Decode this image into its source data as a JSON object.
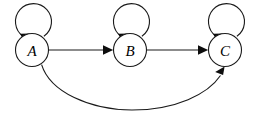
{
  "diagram": {
    "type": "state-transition-graph",
    "title": "",
    "canvas": {
      "width": 262,
      "height": 122,
      "background": "#ffffff"
    },
    "style": {
      "stroke_color": "#1a1a1a",
      "node_fill": "#ffffff",
      "stroke_width": 1.1,
      "label_color": "#000000"
    },
    "nodes": [
      {
        "id": "A",
        "label": "A",
        "cx": 32,
        "cy": 50,
        "r": 16.5
      },
      {
        "id": "B",
        "label": "B",
        "cx": 130,
        "cy": 50,
        "r": 16.5
      },
      {
        "id": "C",
        "label": "C",
        "cx": 225,
        "cy": 50,
        "r": 16.5
      }
    ],
    "edges": [
      {
        "id": "a-self",
        "from": "A",
        "to": "A",
        "kind": "self-loop",
        "label": ""
      },
      {
        "id": "a-to-b",
        "from": "A",
        "to": "B",
        "kind": "straight",
        "label": ""
      },
      {
        "id": "b-self",
        "from": "B",
        "to": "B",
        "kind": "self-loop",
        "label": ""
      },
      {
        "id": "b-to-c",
        "from": "B",
        "to": "C",
        "kind": "straight",
        "label": ""
      },
      {
        "id": "c-self",
        "from": "C",
        "to": "C",
        "kind": "self-loop",
        "label": ""
      },
      {
        "id": "a-to-c",
        "from": "A",
        "to": "C",
        "kind": "curved-below",
        "label": ""
      }
    ]
  }
}
